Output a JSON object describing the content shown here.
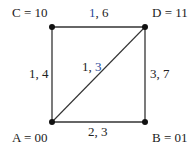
{
  "diagram": {
    "type": "graph",
    "colors": {
      "line": "#333333",
      "text": "#222222",
      "accent": "#2a4a9a"
    },
    "nodes": [
      {
        "id": "A",
        "label": "A = 00",
        "x": 52,
        "y": 122
      },
      {
        "id": "B",
        "label": "B = 01",
        "x": 145,
        "y": 122
      },
      {
        "id": "C",
        "label": "C = 10",
        "x": 52,
        "y": 27
      },
      {
        "id": "D",
        "label": "D = 11",
        "x": 145,
        "y": 27
      }
    ],
    "edges": [
      {
        "from": "C",
        "to": "D",
        "label_a": "1",
        "label_sep": ", ",
        "label_b": "6",
        "highlight": "a"
      },
      {
        "from": "A",
        "to": "C",
        "label_a": "1",
        "label_sep": ", ",
        "label_b": "4",
        "highlight": "none"
      },
      {
        "from": "B",
        "to": "D",
        "label_a": "3",
        "label_sep": ", ",
        "label_b": "7",
        "highlight": "none"
      },
      {
        "from": "A",
        "to": "B",
        "label_a": "2",
        "label_sep": ", ",
        "label_b": "3",
        "highlight": "none"
      },
      {
        "from": "A",
        "to": "D",
        "label_a": "1",
        "label_sep": ", ",
        "label_b": "3",
        "highlight": "b"
      }
    ]
  }
}
